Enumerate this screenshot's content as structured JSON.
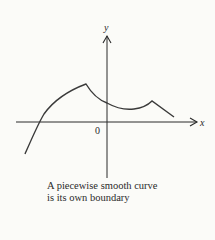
{
  "figure": {
    "axes": {
      "x_label": "x",
      "y_label": "y",
      "origin_label": "0"
    },
    "curve": {
      "description": "piecewise smooth curve with two corner points",
      "stroke_color": "#3a3a3a"
    },
    "caption": {
      "line1": "A piecewise smooth curve",
      "line2": "is its own boundary"
    }
  }
}
